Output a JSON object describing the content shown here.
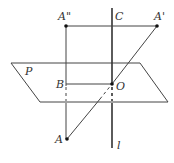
{
  "diagram": {
    "type": "geometry-3d-reflection",
    "plane_label": "P",
    "line_label": "l",
    "points": {
      "A": {
        "label": "A",
        "x": 67,
        "y": 139
      },
      "A_prime": {
        "label": "A'",
        "x": 157,
        "y": 26
      },
      "A_double_prime": {
        "label": "A\"",
        "x": 66,
        "y": 26
      },
      "B": {
        "label": "B",
        "x": 67,
        "y": 84
      },
      "C": {
        "label": "C",
        "x": 112,
        "y": 26
      },
      "O": {
        "label": "O",
        "x": 112,
        "y": 84
      }
    },
    "plane_vertices": [
      [
        11,
        63
      ],
      [
        140,
        63
      ],
      [
        168,
        102
      ],
      [
        40,
        102
      ]
    ],
    "line_l": {
      "x": 112,
      "y_top": 8,
      "y_bottom": 148
    },
    "colors": {
      "stroke": "#444444",
      "label": "#333333",
      "point": "#111111"
    }
  }
}
